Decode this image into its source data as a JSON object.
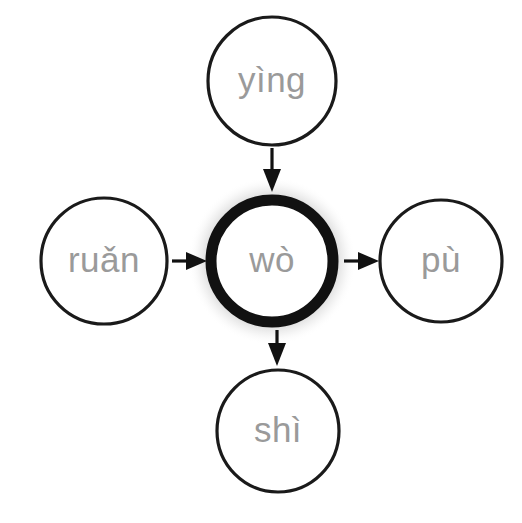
{
  "diagram": {
    "type": "radial-node-arrow-diagram",
    "background_color": "#ffffff",
    "label_color": "#9a9a9a",
    "stroke_color": "#111111",
    "center_node": {
      "id": "wo",
      "label": "wò",
      "cx": 272,
      "cy": 261,
      "r": 61,
      "emphasis": "thick-ring-with-glow",
      "ring_width": 11,
      "glow_color": "#9b9b9b"
    },
    "nodes": [
      {
        "id": "ying",
        "label": "yìng",
        "position": "top",
        "cx": 272,
        "cy": 81,
        "r": 64,
        "ring_width": 3.2
      },
      {
        "id": "ruan",
        "label": "ruǎn",
        "position": "left",
        "cx": 104,
        "cy": 261,
        "r": 63,
        "ring_width": 3.2
      },
      {
        "id": "pu",
        "label": "pù",
        "position": "right",
        "cx": 441,
        "cy": 261,
        "r": 61,
        "ring_width": 3.2
      },
      {
        "id": "shi",
        "label": "shì",
        "position": "bottom",
        "cx": 278,
        "cy": 431,
        "r": 61,
        "ring_width": 3.2
      }
    ],
    "arrows": [
      {
        "id": "ying-to-wo",
        "from": "ying",
        "to": "wo",
        "direction": "down"
      },
      {
        "id": "ruan-to-wo",
        "from": "ruan",
        "to": "wo",
        "direction": "right"
      },
      {
        "id": "wo-to-pu",
        "from": "wo",
        "to": "pu",
        "direction": "right"
      },
      {
        "id": "wo-to-shi",
        "from": "wo",
        "to": "shi",
        "direction": "down"
      }
    ]
  }
}
